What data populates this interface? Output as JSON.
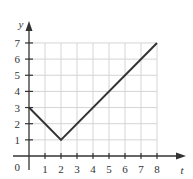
{
  "chart_data": {
    "type": "line",
    "title": "",
    "xlabel": "t",
    "ylabel": "y",
    "x": [
      0,
      2,
      8
    ],
    "series": [
      {
        "name": "y(t)",
        "values": [
          3,
          1,
          7
        ]
      }
    ],
    "xlim": [
      0,
      8
    ],
    "ylim": [
      0,
      7
    ],
    "xticks": [
      "1",
      "2",
      "3",
      "4",
      "5",
      "6",
      "7",
      "8"
    ],
    "yticks": [
      "1",
      "2",
      "3",
      "4",
      "5",
      "6",
      "7"
    ],
    "origin_label": "0",
    "grid": true,
    "legend": "none"
  }
}
